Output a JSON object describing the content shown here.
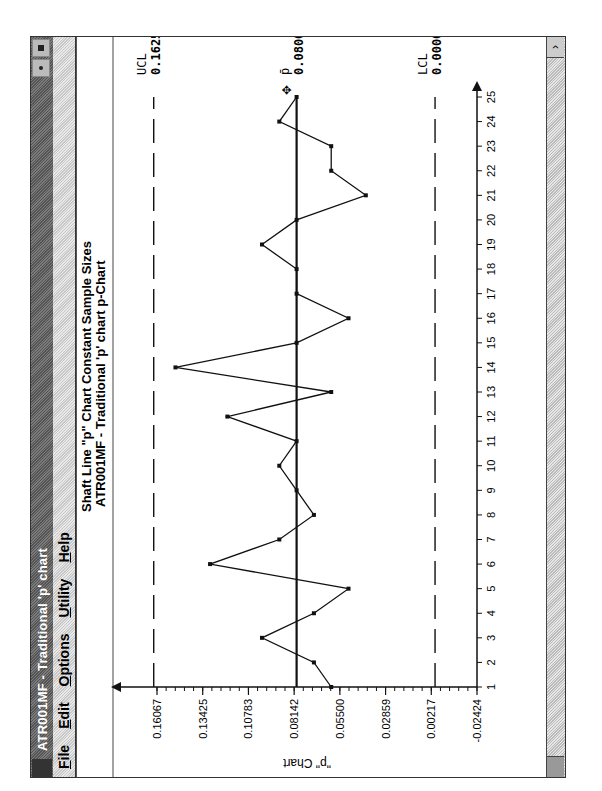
{
  "window": {
    "title": "ATR001MF - Traditional 'p' chart",
    "menu": [
      {
        "label": "File",
        "accel": "F"
      },
      {
        "label": "Edit",
        "accel": "E"
      },
      {
        "label": "Options",
        "accel": "O"
      },
      {
        "label": "Utility",
        "accel": "U"
      },
      {
        "label": "Help",
        "accel": "H"
      }
    ]
  },
  "chart_data": {
    "type": "line",
    "title": "Shaft Line \"p\" Chart   Constant Sample Sizes",
    "subtitle": "ATR001MF - Traditional 'p' chart   p-Chart",
    "xlabel": "",
    "ylabel": "\"p\" Chart",
    "x": [
      1,
      2,
      3,
      4,
      5,
      6,
      7,
      8,
      9,
      10,
      11,
      12,
      13,
      14,
      15,
      16,
      17,
      18,
      19,
      20,
      21,
      22,
      23,
      24,
      25
    ],
    "values": [
      0.06,
      0.07,
      0.1,
      0.07,
      0.05,
      0.13,
      0.09,
      0.07,
      0.08,
      0.09,
      0.08,
      0.12,
      0.06,
      0.15,
      0.08,
      0.05,
      0.08,
      0.08,
      0.1,
      0.08,
      0.04,
      0.06,
      0.06,
      0.09,
      0.08
    ],
    "yticks": [
      "0.16067",
      "0.13425",
      "0.10783",
      "0.08142",
      "0.05500",
      "0.02859",
      "0.00217",
      "-0.02424"
    ],
    "ytick_values": [
      0.16067,
      0.13425,
      0.10783,
      0.08142,
      0.055,
      0.02859,
      0.00217,
      -0.02424
    ],
    "ylim": [
      -0.02424,
      0.17
    ],
    "xlim": [
      1,
      25
    ],
    "control_limits": {
      "ucl": {
        "label": "UCL",
        "value": "0.16256",
        "num": 0.16256
      },
      "center": {
        "label": "p̄",
        "value": "0.08000",
        "num": 0.08
      },
      "lcl": {
        "label": "LCL",
        "value": "0.00000",
        "num": 0.0
      }
    },
    "grid": false,
    "legend": "none"
  }
}
